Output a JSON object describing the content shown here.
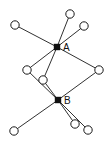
{
  "diagram": {
    "type": "graph",
    "colors": {
      "line": "#1a1a1a",
      "hub_fill": "#111111",
      "node_fill": "#ffffff"
    },
    "hubs": [
      {
        "id": "A",
        "label": "A"
      },
      {
        "id": "B",
        "label": "B"
      }
    ],
    "nodes": [
      {
        "id": "n_top_left"
      },
      {
        "id": "n_top"
      },
      {
        "id": "n_upper_right"
      },
      {
        "id": "n_right"
      },
      {
        "id": "n_left_mid"
      },
      {
        "id": "n_inner"
      },
      {
        "id": "n_bottom_left"
      },
      {
        "id": "n_bottom_1"
      },
      {
        "id": "n_bottom_2"
      }
    ],
    "edges": [
      [
        "A",
        "n_top_left"
      ],
      [
        "A",
        "n_top"
      ],
      [
        "A",
        "n_upper_right"
      ],
      [
        "A",
        "n_right"
      ],
      [
        "A",
        "n_left_mid"
      ],
      [
        "A",
        "n_inner"
      ],
      [
        "B",
        "n_left_mid"
      ],
      [
        "B",
        "n_inner"
      ],
      [
        "B",
        "n_right"
      ],
      [
        "B",
        "n_bottom_left"
      ],
      [
        "B",
        "n_bottom_1"
      ],
      [
        "B",
        "n_bottom_2"
      ]
    ]
  }
}
